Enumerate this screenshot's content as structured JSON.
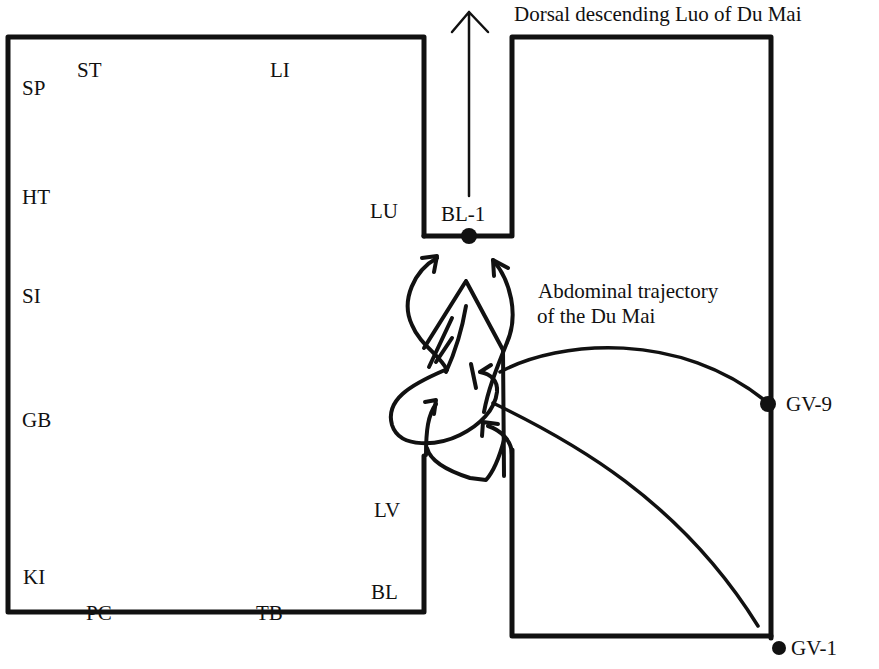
{
  "diagram": {
    "title": "Dorsal descending Luo of Du Mai",
    "annotation": {
      "line1": "Abdominal trajectory",
      "line2": "of the Du Mai"
    },
    "meridian_labels": {
      "SP": "SP",
      "ST": "ST",
      "LI": "LI",
      "HT": "HT",
      "LU": "LU",
      "SI": "SI",
      "GB": "GB",
      "LV": "LV",
      "KI": "KI",
      "PC": "PC",
      "TB": "TB",
      "BL": "BL"
    },
    "points": {
      "bl1": "BL-1",
      "gv9": "GV-9",
      "gv1": "GV-1"
    },
    "colors": {
      "ink": "#111111",
      "background": "#ffffff"
    }
  }
}
